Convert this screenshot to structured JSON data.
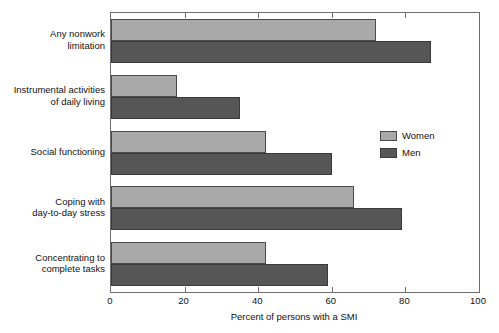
{
  "chart_data": {
    "type": "bar",
    "orientation": "horizontal",
    "title": "",
    "subtitle": "",
    "xlabel": "Percent of persons with a SMI",
    "ylabel": "",
    "xlim": [
      0,
      100
    ],
    "xticks": [
      0,
      20,
      40,
      60,
      80,
      100
    ],
    "xtick_labels": [
      "0",
      "20",
      "40",
      "60",
      "80",
      "100"
    ],
    "grid": false,
    "legend_position": "right-middle",
    "categories": [
      "Any nonwork\nlimitation",
      "Instrumental activities\nof daily living",
      "Social functioning",
      "Coping with\nday-to-day stress",
      "Concentrating to\ncomplete tasks"
    ],
    "series": [
      {
        "name": "Women",
        "color": "#a9a9a9",
        "values": [
          72,
          18,
          42,
          66,
          42
        ]
      },
      {
        "name": "Men",
        "color": "#565656",
        "values": [
          87,
          35,
          60,
          79,
          59
        ]
      }
    ]
  },
  "legend": {
    "items": [
      {
        "label": "Women",
        "color": "#a9a9a9"
      },
      {
        "label": "Men",
        "color": "#565656"
      }
    ]
  },
  "axis": {
    "x_title": "Percent of persons with a SMI",
    "tick_labels": [
      "0",
      "20",
      "40",
      "60",
      "80",
      "100"
    ]
  },
  "colors": {
    "women": "#a9a9a9",
    "men": "#565656",
    "frame": "#6f6f6f",
    "background": "#ffffff",
    "text": "#111111"
  }
}
